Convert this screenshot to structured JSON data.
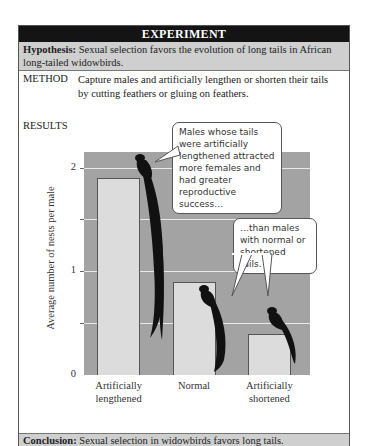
{
  "header": {
    "title": "EXPERIMENT"
  },
  "hypothesis": {
    "label": "Hypothesis:",
    "text": "Sexual selection favors the evolution of long tails in African long-tailed widowbirds."
  },
  "method": {
    "label": "METHOD",
    "text": "Capture males and artificially lengthen or shorten their tails by cutting feathers or gluing on feathers."
  },
  "results": {
    "label": "RESULTS"
  },
  "callouts": [
    {
      "text": "Males whose tails were artificially lengthened attracted more females and had greater reproductive success…"
    },
    {
      "text": "…than males with normal or shortened tails."
    }
  ],
  "conclusion": {
    "label": "Conclusion:",
    "text": "Sexual selection in widowbirds favors long tails."
  },
  "chart_data": {
    "type": "bar",
    "title": "",
    "xlabel": "",
    "ylabel": "Average number of nests per male",
    "categories": [
      "Artificially lengthened",
      "Normal",
      "Artificially shortened"
    ],
    "category_lines": [
      [
        "Artificially",
        "lengthened"
      ],
      [
        "Normal",
        ""
      ],
      [
        "Artificially",
        "shortened"
      ]
    ],
    "values": [
      1.9,
      0.9,
      0.4
    ],
    "ylim": [
      0,
      2.15
    ],
    "yticks": [
      "0",
      "1",
      "2"
    ],
    "gridlines": [
      0.5,
      1,
      1.5,
      2
    ],
    "grid": true,
    "legend": null,
    "colors": {
      "plot_background": "#a3a3a3",
      "bar_fill": "#dcdcdc",
      "bar_stroke": "#555555",
      "bird": "#111111",
      "gridline": "#e8e8e8"
    }
  }
}
